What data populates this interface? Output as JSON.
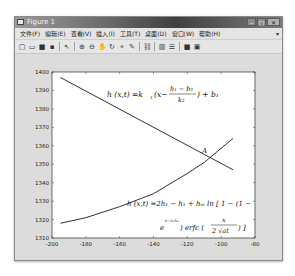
{
  "window": {
    "title": "Figure 1",
    "controls": {
      "minimize": "–",
      "maximize": "□",
      "close": "✕"
    }
  },
  "menubar": {
    "items": [
      {
        "label": "文件(F)"
      },
      {
        "label": "编辑(E)"
      },
      {
        "label": "查看(V)"
      },
      {
        "label": "插入(I)"
      },
      {
        "label": "工具(T)"
      },
      {
        "label": "桌面(D)"
      },
      {
        "label": "窗口(W)"
      },
      {
        "label": "帮助(H)"
      }
    ],
    "overflow": "▾"
  },
  "toolbar": {
    "icons": [
      "new-figure-icon",
      "open-icon",
      "save-icon",
      "print-icon",
      "edit-plot-icon",
      "zoom-in-icon",
      "zoom-out-icon",
      "pan-icon",
      "rotate-icon",
      "data-cursor-icon",
      "brush-icon",
      "link-icon",
      "colorbar-icon",
      "legend-icon",
      "hide-plot-tools-icon",
      "show-plot-tools-icon"
    ],
    "glyphs": [
      "▢",
      "▭",
      "■",
      "▪",
      "↖",
      "⊕",
      "⊖",
      "✋",
      "↻",
      "⌖",
      "✎",
      "⛓",
      "▥",
      "☰",
      "■",
      "▣"
    ]
  },
  "chart_data": {
    "type": "line",
    "title": "",
    "xlabel": "",
    "ylabel": "",
    "xlim": [
      -200,
      -80
    ],
    "ylim": [
      1310,
      1400
    ],
    "xticks": [
      "-200",
      "-180",
      "-160",
      "-140",
      "-120",
      "-100",
      "-80"
    ],
    "yticks": [
      "1310",
      "1320",
      "1330",
      "1340",
      "1350",
      "1360",
      "1370",
      "1380",
      "1390",
      "1400"
    ],
    "grid": false,
    "legend": null,
    "series": [
      {
        "name": "h(x,t)=k1(x-(h1-b2)/k2)+b1",
        "x": [
          -195,
          -93
        ],
        "y": [
          1397,
          1347
        ]
      },
      {
        "name": "h(x,t)=2h1-h1+hm ln[1-(1-e^(h-h1/hm)) erfc(x/(2√(at)))]",
        "x": [
          -195,
          -180,
          -160,
          -140,
          -120,
          -110,
          -93
        ],
        "y": [
          1318,
          1321,
          1327,
          1334,
          1345,
          1351,
          1364
        ]
      }
    ],
    "annotations": [
      {
        "text": "h (x,t) =k₁ (x−(h₁−b₂)/k₂) + b₁",
        "position": "upper-center"
      },
      {
        "text": "A",
        "x": -110,
        "y": 1355
      },
      {
        "text": "h (x,t) =2h₁ − h₁ + hₘ ln [ 1 − (1 − e^(h−h₁/hₘ)) erfc ( x / (2 √(at)) ) ]",
        "position": "lower-right"
      }
    ]
  },
  "annotations_text": {
    "eq1_lhs": "h (x,t) =k",
    "eq1_sub1": "1",
    "eq1_mid": "(x−",
    "eq1_num": "h₁ − b₂",
    "eq1_den": "k₂",
    "eq1_tail": ") + b₁",
    "point_label": "A",
    "eq2_line1": "h (x,t) =2h₁ − h₁ + hₘ ln [ 1 − (1 −",
    "eq2_e": "e",
    "eq2_exp": "h−h₁/hₘ",
    "eq2_erfc": ") erfc (",
    "eq2_num": "x",
    "eq2_den": "2 √at",
    "eq2_tail": ") ]"
  }
}
